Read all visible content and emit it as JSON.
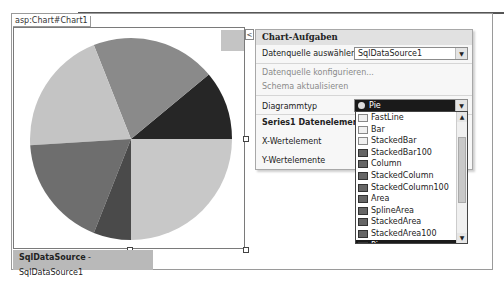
{
  "designer": {
    "control_tag": "asp:Chart#Chart1",
    "datasource_bar": {
      "type": "SqlDataSource",
      "separator": " - ",
      "id": "SqlDataSource1"
    }
  },
  "chart_data": {
    "type": "pie",
    "title": "",
    "slices": [
      {
        "label": "slice-1",
        "value": 11,
        "color": "#262626"
      },
      {
        "label": "slice-2",
        "value": 20,
        "color": "#8a8a8a"
      },
      {
        "label": "slice-3",
        "value": 20,
        "color": "#c4c4c4"
      },
      {
        "label": "slice-4",
        "value": 18,
        "color": "#6e6e6e"
      },
      {
        "label": "slice-5",
        "value": 6,
        "color": "#4a4a4a"
      },
      {
        "label": "slice-6",
        "value": 25,
        "color": "#c8c8c8"
      }
    ],
    "legend": "unlabeled gray square top-right"
  },
  "tasks_panel": {
    "smart_tag_glyph": "<",
    "title": "Chart-Aufgaben",
    "datasource_label": "Datenquelle auswählen:",
    "datasource_value": "SqlDataSource1",
    "configure_link": "Datenquelle konfigurieren...",
    "refresh_schema_link": "Schema aktualisieren",
    "chart_type_label": "Diagrammtyp",
    "chart_type_value": "Pie",
    "series_header": "Series1 Datenelemente",
    "x_member_label": "X-Wertelement",
    "y_members_label": "Y-Wertelemente"
  },
  "chart_type_dropdown": {
    "items": [
      "FastLine",
      "Bar",
      "StackedBar",
      "StackedBar100",
      "Column",
      "StackedColumn",
      "StackedColumn100",
      "Area",
      "SplineArea",
      "StackedArea",
      "StackedArea100",
      "Pie"
    ],
    "selected": "Pie"
  },
  "icons": {
    "dropdown_arrow": "▼",
    "scroll_up": "▲",
    "scroll_down": "▼"
  }
}
